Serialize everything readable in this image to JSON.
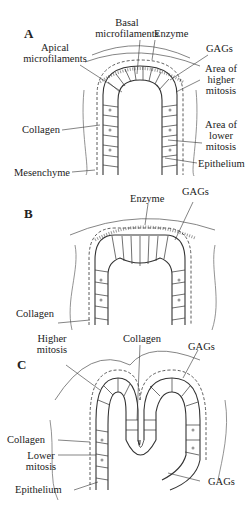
{
  "panels": {
    "a": {
      "letter": "A",
      "labels": {
        "basal1": "Basal",
        "basal2": "microfilaments",
        "enzyme": "Enzyme",
        "apical1": "Apical",
        "apical2": "microfilaments",
        "gags": "GAGs",
        "higher1": "Area of",
        "higher2": "higher",
        "higher3": "mitosis",
        "collagen": "Collagen",
        "lower1": "Area of",
        "lower2": "lower",
        "lower3": "mitosis",
        "mesenchyme": "Mesenchyme",
        "epithelium": "Epithelium"
      }
    },
    "b": {
      "letter": "B",
      "labels": {
        "enzyme": "Enzyme",
        "gags": "GAGs",
        "collagen": "Collagen"
      }
    },
    "c": {
      "letter": "C",
      "labels": {
        "higher1": "Higher",
        "higher2": "mitosis",
        "collagen_top": "Collagen",
        "gags_top": "GAGs",
        "collagen_left": "Collagen",
        "lower1": "Lower",
        "lower2": "mitosis",
        "epithelium": "Epithelium",
        "gags_bottom": "GAGs"
      }
    }
  }
}
